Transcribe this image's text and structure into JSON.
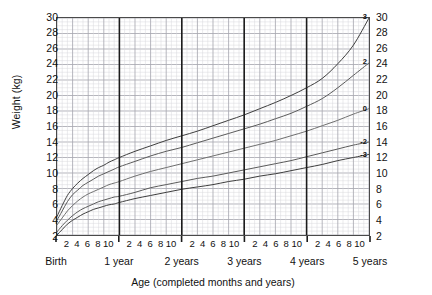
{
  "chart_data": {
    "type": "line",
    "title": "",
    "xlabel": "Age (completed months and years)",
    "ylabel": "Weight (kg)",
    "ylim": [
      2,
      30
    ],
    "xlim": [
      0,
      60
    ],
    "y_ticks": [
      2,
      4,
      6,
      8,
      10,
      12,
      14,
      16,
      18,
      20,
      22,
      24,
      26,
      28,
      30
    ],
    "y_unit": "kg",
    "grid": true,
    "grid_major_y_step": 2,
    "grid_minor_y_step": 0.5,
    "grid_minor_x_step_months": 1,
    "grid_major_x_step_months": 3,
    "legend_position": "curve-end-labels-right",
    "x_year_labels": [
      "Birth",
      "1 year",
      "2 years",
      "3 years",
      "4 years",
      "5 years"
    ],
    "x_year_positions_months": [
      0,
      12,
      24,
      36,
      48,
      60
    ],
    "x_month_ticks": [
      2,
      4,
      6,
      8,
      10
    ],
    "x_month_tick_groups": 5,
    "series": [
      {
        "name": "3",
        "label": "3",
        "z_score": 3,
        "color": "#3c3c3c",
        "end_value": 30.0,
        "x_months": [
          0,
          1,
          2,
          3,
          4,
          5,
          6,
          7,
          8,
          9,
          10,
          11,
          12,
          15,
          18,
          21,
          24,
          27,
          30,
          33,
          36,
          39,
          42,
          45,
          48,
          51,
          54,
          57,
          60
        ],
        "values": [
          4.4,
          5.8,
          7.1,
          8.0,
          8.7,
          9.3,
          9.8,
          10.3,
          10.7,
          11.0,
          11.4,
          11.7,
          12.0,
          12.8,
          13.5,
          14.2,
          14.8,
          15.4,
          16.1,
          16.8,
          17.5,
          18.3,
          19.1,
          20.0,
          21.0,
          22.2,
          24.1,
          26.5,
          30.0
        ]
      },
      {
        "name": "2",
        "label": "2",
        "z_score": 2,
        "color": "#5a5a5a",
        "end_value": 24.2,
        "x_months": [
          0,
          1,
          2,
          3,
          4,
          5,
          6,
          7,
          8,
          9,
          10,
          11,
          12,
          15,
          18,
          21,
          24,
          27,
          30,
          33,
          36,
          39,
          42,
          45,
          48,
          51,
          54,
          57,
          60
        ],
        "values": [
          3.9,
          5.1,
          6.3,
          7.2,
          7.8,
          8.4,
          8.8,
          9.2,
          9.6,
          9.9,
          10.2,
          10.5,
          10.8,
          11.5,
          12.2,
          12.8,
          13.3,
          13.9,
          14.5,
          15.1,
          15.7,
          16.3,
          17.0,
          17.7,
          18.6,
          19.6,
          21.0,
          22.6,
          24.2
        ]
      },
      {
        "name": "0",
        "label": "0",
        "z_score": 0,
        "color": "#6e6e6e",
        "end_value": 18.3,
        "x_months": [
          0,
          1,
          2,
          3,
          4,
          5,
          6,
          7,
          8,
          9,
          10,
          11,
          12,
          15,
          18,
          21,
          24,
          27,
          30,
          33,
          36,
          39,
          42,
          45,
          48,
          51,
          54,
          57,
          60
        ],
        "values": [
          3.3,
          4.2,
          5.1,
          5.8,
          6.4,
          6.9,
          7.3,
          7.6,
          7.9,
          8.2,
          8.5,
          8.7,
          8.9,
          9.6,
          10.2,
          10.7,
          11.2,
          11.7,
          12.2,
          12.7,
          13.2,
          13.7,
          14.2,
          14.8,
          15.4,
          16.1,
          16.8,
          17.6,
          18.3
        ]
      },
      {
        "name": "-2",
        "label": "-2",
        "z_score": -2,
        "color": "#5a5a5a",
        "end_value": 14.0,
        "x_months": [
          0,
          1,
          2,
          3,
          4,
          5,
          6,
          7,
          8,
          9,
          10,
          11,
          12,
          15,
          18,
          21,
          24,
          27,
          30,
          33,
          36,
          39,
          42,
          45,
          48,
          51,
          54,
          57,
          60
        ],
        "values": [
          2.4,
          3.2,
          3.9,
          4.5,
          5.0,
          5.4,
          5.7,
          6.0,
          6.3,
          6.5,
          6.7,
          6.9,
          7.0,
          7.5,
          8.1,
          8.5,
          8.9,
          9.3,
          9.6,
          10.0,
          10.4,
          10.8,
          11.2,
          11.6,
          12.1,
          12.6,
          13.1,
          13.6,
          14.0
        ]
      },
      {
        "name": "-3",
        "label": "-3",
        "z_score": -3,
        "color": "#3c3c3c",
        "end_value": 12.4,
        "x_months": [
          0,
          1,
          2,
          3,
          4,
          5,
          6,
          7,
          8,
          9,
          10,
          11,
          12,
          15,
          18,
          21,
          24,
          27,
          30,
          33,
          36,
          39,
          42,
          45,
          48,
          51,
          54,
          57,
          60
        ],
        "values": [
          2.0,
          2.7,
          3.4,
          3.9,
          4.3,
          4.7,
          5.0,
          5.3,
          5.5,
          5.7,
          5.9,
          6.0,
          6.2,
          6.7,
          7.1,
          7.5,
          7.9,
          8.2,
          8.5,
          8.9,
          9.2,
          9.6,
          9.9,
          10.3,
          10.7,
          11.1,
          11.6,
          12.0,
          12.4
        ]
      }
    ]
  },
  "colors": {
    "frame": "#4a4a4a",
    "grid_minor": "#d8d8dc",
    "grid_major": "#a8a8b0",
    "year_line": "#1c1c1c",
    "text": "#111111",
    "background": "#ffffff"
  }
}
